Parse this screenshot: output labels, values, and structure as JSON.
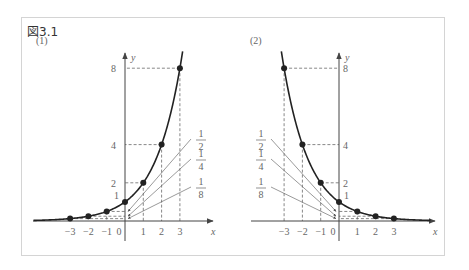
{
  "figure": {
    "title": "図3.1",
    "panels": [
      {
        "label": "(1)",
        "function": "y = 2^x",
        "axis_x_label": "x",
        "axis_y_label": "y",
        "x_ticks": [
          "-3",
          "-2",
          "-1",
          "0",
          "1",
          "2",
          "3"
        ],
        "y_ticks": [
          "1",
          "2",
          "4",
          "8"
        ],
        "points": [
          [
            -3,
            0.125
          ],
          [
            -2,
            0.25
          ],
          [
            -1,
            0.5
          ],
          [
            0,
            1
          ],
          [
            1,
            2
          ],
          [
            2,
            4
          ],
          [
            3,
            8
          ]
        ],
        "annotations": [
          {
            "num": "1",
            "den": "2"
          },
          {
            "num": "1",
            "den": "4"
          },
          {
            "num": "1",
            "den": "8"
          }
        ]
      },
      {
        "label": "(2)",
        "function": "y = (1/2)^x",
        "axis_x_label": "x",
        "axis_y_label": "y",
        "x_ticks": [
          "-3",
          "-2",
          "-1",
          "0",
          "1",
          "2",
          "3"
        ],
        "y_ticks": [
          "1",
          "2",
          "4",
          "8"
        ],
        "points": [
          [
            -3,
            8
          ],
          [
            -2,
            4
          ],
          [
            -1,
            2
          ],
          [
            0,
            1
          ],
          [
            1,
            0.5
          ],
          [
            2,
            0.25
          ],
          [
            3,
            0.125
          ]
        ],
        "annotations": [
          {
            "num": "1",
            "den": "2"
          },
          {
            "num": "1",
            "den": "4"
          },
          {
            "num": "1",
            "den": "8"
          }
        ]
      }
    ]
  }
}
